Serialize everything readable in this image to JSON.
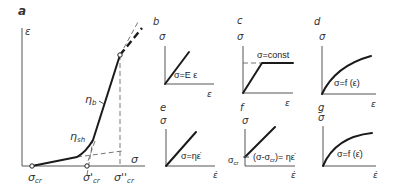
{
  "figure": {
    "panels": {
      "a": {
        "label": "a",
        "y_axis": "ε",
        "x_axis": "σ",
        "slope_labels": [
          "η_sh",
          "η_b"
        ],
        "slope_label_sh": "η",
        "slope_label_sh_sub": "sh",
        "slope_label_b": "η",
        "slope_label_b_sub": "b",
        "x_ticks": [
          "σ_cr",
          "σ'_cr",
          "σ''_cr"
        ],
        "tick1": "σ",
        "tick1_sub": "cr",
        "tick2": "σ'",
        "tick2_sub": "cr",
        "tick3": "σ''",
        "tick3_sub": "cr"
      },
      "b": {
        "label": "b",
        "y_axis": "σ",
        "x_axis": "ε",
        "equation": "σ=E ε"
      },
      "c": {
        "label": "c",
        "y_axis": "σ",
        "x_axis": "ε",
        "equation": "σ=const"
      },
      "d": {
        "label": "d",
        "y_axis": "σ",
        "x_axis": "ε",
        "equation": "σ=f (ε)"
      },
      "e": {
        "label": "e",
        "y_axis": "σ",
        "x_axis": "ε̇",
        "equation": "σ=ηε̇"
      },
      "f": {
        "label": "f",
        "y_axis": "σ",
        "x_axis": "ε̇",
        "equation": "(σ-σ",
        "equation_sub": "cr",
        "equation_tail": ")= ηε̇",
        "offset_label": "σ",
        "offset_sub": "cr"
      },
      "g": {
        "label": "g",
        "y_axis": "σ",
        "x_axis": "ε̇",
        "equation": "σ=f (ε̇)"
      }
    }
  }
}
